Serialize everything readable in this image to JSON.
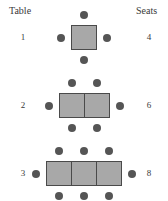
{
  "header": {
    "table_label": "Table",
    "seats_label": "Seats"
  },
  "colors": {
    "table_fill": "#a8a8a8",
    "table_border": "#4a4a4a",
    "seat_fill": "#555555",
    "text": "#3a3a3a",
    "background": "#ffffff"
  },
  "rows": [
    {
      "table_number": "1",
      "seat_count": "4",
      "units": 1,
      "seats_top": 1,
      "seats_bottom": 1,
      "seats_left": 1,
      "seats_right": 1
    },
    {
      "table_number": "2",
      "seat_count": "6",
      "units": 2,
      "seats_top": 2,
      "seats_bottom": 2,
      "seats_left": 1,
      "seats_right": 1
    },
    {
      "table_number": "3",
      "seat_count": "8",
      "units": 3,
      "seats_top": 3,
      "seats_bottom": 3,
      "seats_left": 1,
      "seats_right": 1
    }
  ]
}
